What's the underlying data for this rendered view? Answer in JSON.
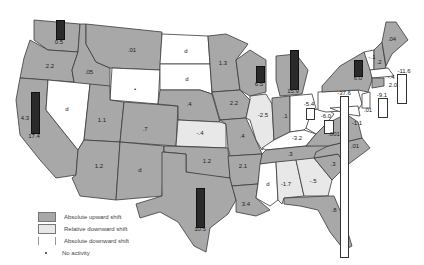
{
  "map": {
    "colors": {
      "absolute_upward": "#a8a8a8",
      "relative_downward": "#e8e8e8",
      "absolute_downward": "#ffffff",
      "border": "#333333"
    },
    "states": [
      {
        "name": "WA",
        "value": "0.5",
        "shift": "up"
      },
      {
        "name": "OR",
        "value": "2.2",
        "shift": "up"
      },
      {
        "name": "CA",
        "value": "17.4",
        "shift": "up"
      },
      {
        "name": "CA-left",
        "value": "4.3"
      },
      {
        "name": "ID",
        "value": ".05",
        "shift": "up"
      },
      {
        "name": "MT",
        "value": ".01",
        "shift": "up"
      },
      {
        "name": "NV",
        "value": "d",
        "shift": "abs-down"
      },
      {
        "name": "UT",
        "value": "1.1",
        "shift": "up"
      },
      {
        "name": "WY",
        "value": "•",
        "shift": "none"
      },
      {
        "name": "CO",
        "value": ".7",
        "shift": "up"
      },
      {
        "name": "AZ",
        "value": "1.2",
        "shift": "up"
      },
      {
        "name": "NM",
        "value": "d",
        "shift": "up"
      },
      {
        "name": "ND",
        "value": "d",
        "shift": "abs-down"
      },
      {
        "name": "SD",
        "value": "d",
        "shift": "abs-down"
      },
      {
        "name": "NE",
        "value": ".4",
        "shift": "up"
      },
      {
        "name": "KS",
        "value": "-.4",
        "shift": "rel-down"
      },
      {
        "name": "OK",
        "value": "1.2",
        "shift": "up"
      },
      {
        "name": "TX",
        "value": "10.5",
        "shift": "up"
      },
      {
        "name": "MN",
        "value": "1.3",
        "shift": "up"
      },
      {
        "name": "IA",
        "value": "2.2",
        "shift": "up"
      },
      {
        "name": "MO",
        "value": ".4",
        "shift": "up"
      },
      {
        "name": "AR",
        "value": "2.1",
        "shift": "up"
      },
      {
        "name": "LA",
        "value": "3.4",
        "shift": "up"
      },
      {
        "name": "WI",
        "value": "6.5",
        "shift": "up"
      },
      {
        "name": "IL",
        "value": "-2.5",
        "shift": "rel-down"
      },
      {
        "name": "MI",
        "value": "15.9",
        "shift": "up"
      },
      {
        "name": "IN",
        "value": ".1",
        "shift": "up"
      },
      {
        "name": "OH",
        "value": "-5.4",
        "shift": "abs-down"
      },
      {
        "name": "KY",
        "value": "-3.2",
        "shift": "abs-down"
      },
      {
        "name": "TN",
        "value": ".3",
        "shift": "up"
      },
      {
        "name": "MS",
        "value": "d",
        "shift": "abs-down"
      },
      {
        "name": "AL",
        "value": "-1.7",
        "shift": "rel-down"
      },
      {
        "name": "GA",
        "value": "-.5",
        "shift": "rel-down"
      },
      {
        "name": "FL",
        "value": ".8",
        "shift": "up"
      },
      {
        "name": "SC",
        "value": ".3",
        "shift": "up"
      },
      {
        "name": "NC",
        "value": ".01",
        "shift": "up"
      },
      {
        "name": "VA",
        "value": ".001",
        "shift": "up"
      },
      {
        "name": "WV",
        "value": "-6.0",
        "shift": "abs-down"
      },
      {
        "name": "PA",
        "value": "-37.6",
        "shift": "abs-down"
      },
      {
        "name": "NY",
        "value": "6.0",
        "shift": "up"
      },
      {
        "name": "VT",
        "value": "-.1",
        "shift": "abs-down"
      },
      {
        "name": "NH",
        "value": ".2",
        "shift": "up"
      },
      {
        "name": "ME",
        "value": ".04",
        "shift": "up"
      },
      {
        "name": "MA",
        "value": "-11.6",
        "shift": "abs-down"
      },
      {
        "name": "CT",
        "value": "2.0",
        "shift": "up"
      },
      {
        "name": "RI",
        "value": "-.4"
      },
      {
        "name": "NJ",
        "value": "-9.1",
        "shift": "abs-down"
      },
      {
        "name": "DE",
        "value": ".01"
      },
      {
        "name": "MD",
        "value": "-1.1",
        "shift": "abs-down"
      }
    ]
  },
  "legend": {
    "items": [
      {
        "label": "Absolute upward shift"
      },
      {
        "label": "Relative downward shift"
      },
      {
        "label": "Absolute downward shift"
      },
      {
        "label": "No activity"
      }
    ]
  }
}
